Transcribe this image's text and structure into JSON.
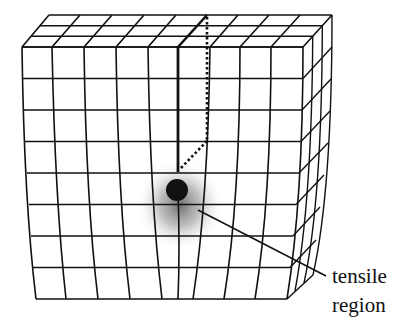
{
  "diagram": {
    "annotation": {
      "line1": "tensile",
      "line2": "region"
    },
    "colors": {
      "mesh": "#111111",
      "particle": "#111111",
      "shading": "#6a6a6a",
      "background": "#ffffff"
    }
  }
}
